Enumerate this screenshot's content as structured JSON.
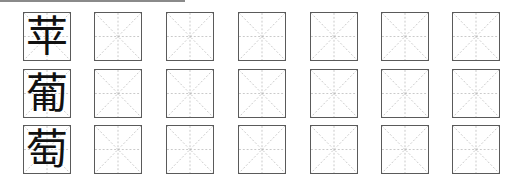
{
  "worksheet": {
    "rows": [
      {
        "character": "苹",
        "empty_cells": 6
      },
      {
        "character": "葡",
        "empty_cells": 6
      },
      {
        "character": "萄",
        "empty_cells": 6
      }
    ],
    "columns": 7,
    "cell_style": "米字格",
    "colors": {
      "border": "#5a5a5a",
      "guide": "#b0b0b0",
      "ink": "#111111"
    }
  }
}
